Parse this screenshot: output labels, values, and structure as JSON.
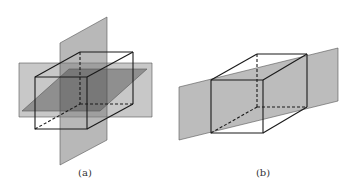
{
  "figure": {
    "panels": [
      {
        "id": "a",
        "caption": "(a)",
        "description": "Cube intersected by three mutually perpendicular planes through its center",
        "colors": {
          "plane_fill": "#8a8a8a",
          "plane_opacity": 0.55,
          "horizontal_plane_fill": "#555555",
          "edge": "#1a1a1a"
        }
      },
      {
        "id": "b",
        "caption": "(b)",
        "description": "Cube intersected by a diagonal plane through two opposite edges",
        "colors": {
          "plane_fill": "#9a9a9a",
          "plane_opacity": 0.7,
          "edge": "#1a1a1a"
        }
      }
    ]
  }
}
